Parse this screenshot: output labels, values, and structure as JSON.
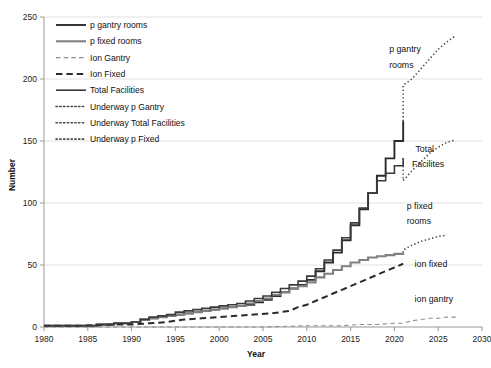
{
  "chart_data": {
    "type": "line",
    "title": "",
    "xlabel": "Year",
    "ylabel": "Number",
    "xlim": [
      1980,
      2030
    ],
    "ylim": [
      0,
      250
    ],
    "grid": true,
    "xticks": [
      1980,
      1985,
      1990,
      1995,
      2000,
      2005,
      2010,
      2015,
      2020,
      2025,
      2030
    ],
    "yticks": [
      0,
      50,
      100,
      150,
      200,
      250
    ],
    "legend_position": "upper-left",
    "series": [
      {
        "name": "p gantry rooms",
        "style": "solid",
        "color": "#2b2b2b",
        "width": 1.9,
        "x": [
          1980,
          1984,
          1986,
          1988,
          1990,
          1991,
          1992,
          1993,
          1994,
          1995,
          1996,
          1997,
          1998,
          1999,
          2000,
          2001,
          2002,
          2003,
          2004,
          2005,
          2006,
          2007,
          2008,
          2009,
          2010,
          2011,
          2012,
          2013,
          2014,
          2015,
          2016,
          2017,
          2018,
          2019,
          2020,
          2021
        ],
        "values": [
          1,
          1,
          2,
          3,
          4,
          6,
          7,
          8,
          9,
          10,
          11,
          12,
          13,
          14,
          15,
          16,
          17,
          18,
          20,
          22,
          25,
          28,
          31,
          34,
          38,
          45,
          52,
          60,
          70,
          82,
          95,
          108,
          122,
          136,
          150,
          166
        ]
      },
      {
        "name": "p fixed rooms",
        "style": "solid",
        "color": "#808080",
        "width": 2.1,
        "x": [
          1980,
          1984,
          1986,
          1988,
          1990,
          1991,
          1992,
          1993,
          1994,
          1995,
          1996,
          1997,
          1998,
          1999,
          2000,
          2001,
          2002,
          2003,
          2004,
          2005,
          2006,
          2007,
          2008,
          2009,
          2010,
          2011,
          2012,
          2013,
          2014,
          2015,
          2016,
          2017,
          2018,
          2019,
          2020,
          2021
        ],
        "values": [
          1,
          1,
          2,
          3,
          4,
          6,
          7,
          8,
          9,
          10,
          11,
          12,
          13,
          14,
          15,
          16,
          17,
          19,
          21,
          23,
          26,
          28,
          31,
          33,
          36,
          40,
          43,
          46,
          49,
          52,
          54,
          56,
          57,
          58,
          59,
          60
        ]
      },
      {
        "name": "Ion Gantry",
        "style": "dashed-thin",
        "color": "#8f8f8f",
        "width": 1.1,
        "x": [
          1980,
          1990,
          1995,
          2000,
          2005,
          2010,
          2012,
          2014,
          2016,
          2018,
          2020,
          2021,
          2022,
          2023,
          2024,
          2025,
          2026,
          2027
        ],
        "values": [
          0,
          0,
          0,
          0,
          0,
          1,
          1,
          1,
          2,
          2,
          3,
          3,
          5,
          6,
          7,
          7,
          8,
          8
        ]
      },
      {
        "name": "Ion Fixed",
        "style": "dashed",
        "color": "#2b2b2b",
        "width": 2.0,
        "x": [
          1980,
          1984,
          1988,
          1990,
          1992,
          1994,
          1995,
          1996,
          1998,
          2000,
          2002,
          2004,
          2006,
          2008,
          2009,
          2010,
          2011,
          2012,
          2013,
          2014,
          2015,
          2016,
          2017,
          2018,
          2019,
          2020,
          2021
        ],
        "values": [
          1,
          1,
          2,
          2,
          3,
          4,
          5,
          6,
          7,
          8,
          9,
          10,
          11,
          13,
          16,
          18,
          21,
          24,
          27,
          30,
          33,
          36,
          39,
          42,
          45,
          48,
          51
        ]
      },
      {
        "name": "Total Facilities",
        "style": "solid",
        "color": "#3a3a3a",
        "width": 1.6,
        "x": [
          1980,
          1984,
          1986,
          1988,
          1990,
          1991,
          1992,
          1993,
          1994,
          1995,
          1996,
          1997,
          1998,
          1999,
          2000,
          2001,
          2002,
          2003,
          2004,
          2005,
          2006,
          2007,
          2008,
          2009,
          2010,
          2011,
          2012,
          2013,
          2014,
          2015,
          2016,
          2017,
          2018,
          2019,
          2020,
          2021
        ],
        "values": [
          1,
          1,
          2,
          3,
          4,
          6,
          8,
          9,
          10,
          12,
          13,
          14,
          15,
          16,
          17,
          18,
          19,
          21,
          23,
          25,
          28,
          31,
          34,
          37,
          41,
          47,
          54,
          62,
          72,
          84,
          96,
          108,
          118,
          124,
          130,
          136
        ]
      },
      {
        "name": "Underway p Gantry",
        "style": "dotted",
        "color": "#4a4a4a",
        "width": 1.6,
        "x": [
          2021,
          2021,
          2022,
          2023,
          2024,
          2025,
          2026,
          2027
        ],
        "values": [
          166,
          195,
          200,
          208,
          216,
          224,
          230,
          235
        ]
      },
      {
        "name": "Underway Total Facilities",
        "style": "dotted",
        "color": "#4a4a4a",
        "width": 1.6,
        "x": [
          2021,
          2021,
          2022,
          2023,
          2024,
          2025,
          2026,
          2027
        ],
        "values": [
          136,
          118,
          126,
          133,
          140,
          145,
          149,
          151
        ]
      },
      {
        "name": "Underway p Fixed",
        "style": "dotted",
        "color": "#4a4a4a",
        "width": 1.6,
        "x": [
          2021,
          2021,
          2022,
          2023,
          2024,
          2025,
          2026
        ],
        "values": [
          60,
          62,
          66,
          69,
          71,
          73,
          74
        ]
      }
    ],
    "annotations": [
      {
        "text": "p gantry",
        "x": 2019.4,
        "y": 222
      },
      {
        "text": "rooms",
        "x": 2019.4,
        "y": 209
      },
      {
        "text": "Total",
        "x": 2022.4,
        "y": 141
      },
      {
        "text": "Facilites",
        "x": 2022.0,
        "y": 129
      },
      {
        "text": "p fixed",
        "x": 2021.4,
        "y": 95
      },
      {
        "text": "rooms",
        "x": 2021.4,
        "y": 83
      },
      {
        "text": "ion fixed",
        "x": 2022.3,
        "y": 48
      },
      {
        "text": "ion gantry",
        "x": 2022.3,
        "y": 20
      }
    ]
  },
  "legend": {
    "items": [
      {
        "label": "p gantry rooms"
      },
      {
        "label": "p fixed rooms"
      },
      {
        "label": "Ion Gantry"
      },
      {
        "label": "Ion Fixed"
      },
      {
        "label": "Total Facilities"
      },
      {
        "label": "Underway p Gantry"
      },
      {
        "label": "Underway Total Facilities"
      },
      {
        "label": "Underway p Fixed"
      }
    ]
  }
}
